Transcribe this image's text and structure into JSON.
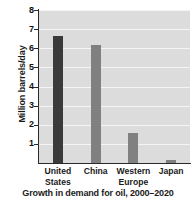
{
  "chart_data": {
    "type": "bar",
    "title": "",
    "caption": "Growth in demand for oil, 2000–2020",
    "xlabel": "",
    "ylabel": "Million barrels/day",
    "categories": [
      "United\nStates",
      "China",
      "Western\nEurope",
      "Japan"
    ],
    "values": [
      6.65,
      6.15,
      1.55,
      0.15
    ],
    "bar_colors": [
      "#3a3a3a",
      "#808080",
      "#808080",
      "#808080"
    ],
    "ylim": [
      0,
      8
    ],
    "yticks": [
      8,
      7,
      6,
      5,
      4,
      3,
      2,
      1
    ],
    "ytick_labels": [
      "8",
      "7",
      "6",
      "5",
      "4",
      "3",
      "2",
      "1"
    ],
    "grid": true,
    "gridline_color": "#f4f4f4",
    "plot_background": "#dcdcdc",
    "figure_background": "#ffffff",
    "axis_color": "#2b2b2b",
    "legend": null
  }
}
